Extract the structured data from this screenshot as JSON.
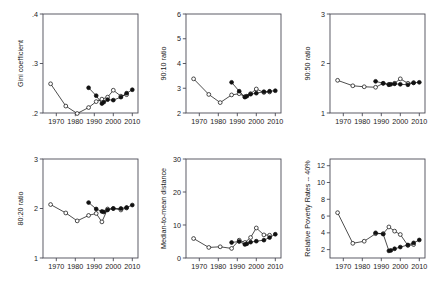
{
  "figure": {
    "layout": "2 rows x 3 columns of scatter-line panels",
    "background": "#ffffff",
    "series_styles": [
      {
        "name": "open-circle-series",
        "marker": "open circle",
        "color": "#000000"
      },
      {
        "name": "filled-circle-series",
        "marker": "filled circle",
        "color": "#000000"
      }
    ]
  },
  "chart_data": [
    {
      "type": "line",
      "panel": "top-left",
      "title": "",
      "xlabel": "",
      "ylabel": "Gini coefficient",
      "xlim": [
        1963,
        2013
      ],
      "ylim": [
        0.2,
        0.4
      ],
      "xticks": [
        1970,
        1980,
        1990,
        2000,
        2010
      ],
      "xticklabels": [
        "1970",
        "1980",
        "1990",
        "2000",
        "2010"
      ],
      "yticks": [
        0.2,
        0.3,
        0.4
      ],
      "yticklabels": [
        ".2",
        ".3",
        ".4"
      ],
      "grid": false,
      "legend": "none",
      "series": [
        {
          "name": "open-circle-series",
          "marker": "open",
          "x": [
            1967,
            1975,
            1981,
            1987,
            1991,
            1994,
            1997,
            2000,
            2004,
            2007
          ],
          "values": [
            0.259,
            0.214,
            0.199,
            0.211,
            0.223,
            0.228,
            0.232,
            0.246,
            0.234,
            0.237
          ]
        },
        {
          "name": "filled-circle-series",
          "marker": "filled",
          "x": [
            1987,
            1991,
            1994,
            1995,
            1997,
            2000,
            2004,
            2007,
            2010
          ],
          "values": [
            0.251,
            0.235,
            0.219,
            0.222,
            0.227,
            0.226,
            0.232,
            0.24,
            0.247
          ]
        }
      ]
    },
    {
      "type": "line",
      "panel": "top-middle",
      "title": "",
      "xlabel": "",
      "ylabel": "90:10 ratio",
      "xlim": [
        1963,
        2013
      ],
      "ylim": [
        2,
        6
      ],
      "xticks": [
        1970,
        1980,
        1990,
        2000,
        2010
      ],
      "xticklabels": [
        "1970",
        "1980",
        "1990",
        "2000",
        "2010"
      ],
      "yticks": [
        2,
        3,
        4,
        5,
        6
      ],
      "yticklabels": [
        "2",
        "3",
        "4",
        "5",
        "6"
      ],
      "grid": false,
      "legend": "none",
      "series": [
        {
          "name": "open-circle-series",
          "marker": "open",
          "x": [
            1967,
            1975,
            1981,
            1987,
            1991,
            1994,
            1997,
            2000,
            2004,
            2007
          ],
          "values": [
            3.38,
            2.75,
            2.42,
            2.73,
            2.78,
            2.66,
            2.78,
            2.97,
            2.83,
            2.85
          ]
        },
        {
          "name": "filled-circle-series",
          "marker": "filled",
          "x": [
            1987,
            1991,
            1994,
            1995,
            1997,
            2000,
            2004,
            2007,
            2010
          ],
          "values": [
            3.24,
            2.88,
            2.64,
            2.68,
            2.76,
            2.8,
            2.86,
            2.88,
            2.9
          ]
        }
      ]
    },
    {
      "type": "line",
      "panel": "top-right",
      "title": "",
      "xlabel": "",
      "ylabel": "90:50 ratio",
      "xlim": [
        1963,
        2013
      ],
      "ylim": [
        1,
        3
      ],
      "xticks": [
        1970,
        1980,
        1990,
        2000,
        2010
      ],
      "xticklabels": [
        "1970",
        "1980",
        "1990",
        "2000",
        "2010"
      ],
      "yticks": [
        1,
        2,
        3
      ],
      "yticklabels": [
        "1",
        "2",
        "3"
      ],
      "grid": false,
      "legend": "none",
      "series": [
        {
          "name": "open-circle-series",
          "marker": "open",
          "x": [
            1967,
            1975,
            1981,
            1987,
            1991,
            1994,
            1997,
            2000,
            2004,
            2007
          ],
          "values": [
            1.66,
            1.55,
            1.53,
            1.52,
            1.6,
            1.58,
            1.6,
            1.69,
            1.6,
            1.61
          ]
        },
        {
          "name": "filled-circle-series",
          "marker": "filled",
          "x": [
            1987,
            1991,
            1994,
            1995,
            1997,
            2000,
            2004,
            2007,
            2010
          ],
          "values": [
            1.64,
            1.6,
            1.57,
            1.58,
            1.59,
            1.58,
            1.57,
            1.61,
            1.62
          ]
        }
      ]
    },
    {
      "type": "line",
      "panel": "bottom-left",
      "title": "",
      "xlabel": "",
      "ylabel": "80:20 ratio",
      "xlim": [
        1963,
        2013
      ],
      "ylim": [
        1,
        3
      ],
      "xticks": [
        1970,
        1980,
        1990,
        2000,
        2010
      ],
      "xticklabels": [
        "1970",
        "1980",
        "1990",
        "2000",
        "2010"
      ],
      "yticks": [
        1,
        2,
        3
      ],
      "yticklabels": [
        "1",
        "2",
        "3"
      ],
      "grid": false,
      "legend": "none",
      "series": [
        {
          "name": "open-circle-series",
          "marker": "open",
          "x": [
            1967,
            1975,
            1981,
            1987,
            1991,
            1994,
            1997,
            2000,
            2004,
            2007
          ],
          "values": [
            2.08,
            1.91,
            1.75,
            1.86,
            1.9,
            1.73,
            1.99,
            2.0,
            1.97,
            2.01
          ]
        },
        {
          "name": "filled-circle-series",
          "marker": "filled",
          "x": [
            1987,
            1991,
            1994,
            1995,
            1997,
            2000,
            2004,
            2007,
            2010
          ],
          "values": [
            2.12,
            1.99,
            1.94,
            1.93,
            1.97,
            2.0,
            2.0,
            2.02,
            2.07
          ]
        }
      ]
    },
    {
      "type": "line",
      "panel": "bottom-middle",
      "title": "",
      "xlabel": "",
      "ylabel": "Median-to-mean distance",
      "xlim": [
        1963,
        2013
      ],
      "ylim": [
        0,
        30
      ],
      "xticks": [
        1970,
        1980,
        1990,
        2000,
        2010
      ],
      "xticklabels": [
        "1970",
        "1980",
        "1990",
        "2000",
        "2010"
      ],
      "yticks": [
        0,
        10,
        20,
        30
      ],
      "yticklabels": [
        "0",
        "10",
        "20",
        "30"
      ],
      "grid": false,
      "legend": "none",
      "series": [
        {
          "name": "open-circle-series",
          "marker": "open",
          "x": [
            1967,
            1975,
            1981,
            1987,
            1991,
            1994,
            1997,
            2000,
            2004,
            2007
          ],
          "values": [
            5.9,
            3.2,
            3.4,
            2.9,
            5.4,
            4.7,
            6.2,
            9.1,
            7.0,
            6.9
          ]
        },
        {
          "name": "filled-circle-series",
          "marker": "filled",
          "x": [
            1987,
            1991,
            1994,
            1995,
            1997,
            2000,
            2004,
            2007,
            2010
          ],
          "values": [
            4.7,
            5.0,
            4.1,
            4.3,
            4.8,
            5.1,
            5.4,
            6.2,
            7.2
          ]
        }
      ]
    },
    {
      "type": "line",
      "panel": "bottom-right",
      "title": "",
      "xlabel": "",
      "ylabel": "Relative Poverty Rates -- 40%",
      "xlim": [
        1963,
        2013
      ],
      "ylim": [
        1,
        12.8
      ],
      "xticks": [
        1970,
        1980,
        1990,
        2000,
        2010
      ],
      "xticklabels": [
        "1970",
        "1980",
        "1990",
        "2000",
        "2010"
      ],
      "yticks": [
        2,
        4,
        6,
        8,
        10,
        12
      ],
      "yticklabels": [
        "2",
        "4",
        "6",
        "8",
        "10",
        "12"
      ],
      "grid": false,
      "legend": "none",
      "series": [
        {
          "name": "open-circle-series",
          "marker": "open",
          "x": [
            1967,
            1975,
            1981,
            1987,
            1991,
            1994,
            1997,
            2000,
            2004,
            2007
          ],
          "values": [
            6.4,
            2.75,
            3.0,
            3.9,
            3.9,
            4.7,
            4.2,
            3.8,
            2.5,
            2.6
          ]
        },
        {
          "name": "filled-circle-series",
          "marker": "filled",
          "x": [
            1987,
            1991,
            1994,
            1995,
            1997,
            2000,
            2004,
            2007,
            2010
          ],
          "values": [
            4.0,
            3.85,
            1.85,
            1.9,
            2.1,
            2.3,
            2.55,
            2.8,
            3.15
          ]
        }
      ]
    }
  ]
}
